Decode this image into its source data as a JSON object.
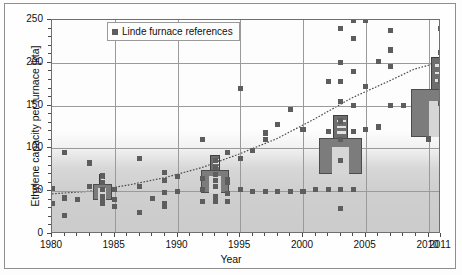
{
  "figure": {
    "background": "#fdfdfd",
    "frame_color": "#8e8e8e"
  },
  "legend": {
    "label": "Linde furnace references",
    "marker": "square-marker",
    "position": "top-left-inside"
  },
  "axes": {
    "x_title": "Year",
    "y_title": "Ethylene capacity per furnace [kta]",
    "x_ticks": [
      "1980",
      "1985",
      "1990",
      "1995",
      "2000",
      "2005",
      "2010",
      "2011"
    ],
    "y_ticks": [
      "0",
      "50",
      "100",
      "150",
      "200",
      "250"
    ]
  },
  "chart_data": {
    "type": "scatter",
    "title": "",
    "subtitle": "",
    "xlabel": "Year",
    "ylabel": "Ethylene capacity per furnace [kta]",
    "xlim": [
      1980,
      2011
    ],
    "ylim": [
      0,
      250
    ],
    "grid": true,
    "legend_position": "top-left-inside",
    "series": [
      {
        "name": "Linde furnace references",
        "marker": "square",
        "color": "#5d5d5d",
        "points": [
          [
            1980,
            53
          ],
          [
            1980,
            36
          ],
          [
            1981,
            95
          ],
          [
            1981,
            42
          ],
          [
            1981,
            22
          ],
          [
            1982,
            40
          ],
          [
            1983,
            83
          ],
          [
            1983,
            55
          ],
          [
            1984,
            68
          ],
          [
            1984,
            60
          ],
          [
            1984,
            52
          ],
          [
            1984,
            44
          ],
          [
            1984,
            40
          ],
          [
            1984,
            36
          ],
          [
            1985,
            52
          ],
          [
            1985,
            40
          ],
          [
            1985,
            32
          ],
          [
            1987,
            88
          ],
          [
            1987,
            56
          ],
          [
            1987,
            25
          ],
          [
            1988,
            41
          ],
          [
            1989,
            72
          ],
          [
            1989,
            63
          ],
          [
            1989,
            48
          ],
          [
            1989,
            36
          ],
          [
            1989,
            32
          ],
          [
            1990,
            67
          ],
          [
            1990,
            50
          ],
          [
            1992,
            110
          ],
          [
            1992,
            65
          ],
          [
            1992,
            52
          ],
          [
            1992,
            38
          ],
          [
            1993,
            86
          ],
          [
            1993,
            78
          ],
          [
            1993,
            70
          ],
          [
            1993,
            62
          ],
          [
            1993,
            55
          ],
          [
            1993,
            44
          ],
          [
            1993,
            38
          ],
          [
            1994,
            95
          ],
          [
            1994,
            64
          ],
          [
            1994,
            60
          ],
          [
            1994,
            47
          ],
          [
            1994,
            38
          ],
          [
            1995,
            170
          ],
          [
            1995,
            88
          ],
          [
            1995,
            52
          ],
          [
            1996,
            98
          ],
          [
            1996,
            50
          ],
          [
            1997,
            118
          ],
          [
            1997,
            110
          ],
          [
            1997,
            50
          ],
          [
            1998,
            128
          ],
          [
            1998,
            50
          ],
          [
            1999,
            145
          ],
          [
            1999,
            50
          ],
          [
            2000,
            122
          ],
          [
            2000,
            50
          ],
          [
            2001,
            52
          ],
          [
            2002,
            178
          ],
          [
            2002,
            120
          ],
          [
            2002,
            52
          ],
          [
            2003,
            240
          ],
          [
            2003,
            200
          ],
          [
            2003,
            178
          ],
          [
            2003,
            155
          ],
          [
            2003,
            132
          ],
          [
            2003,
            110
          ],
          [
            2003,
            86
          ],
          [
            2003,
            52
          ],
          [
            2003,
            30
          ],
          [
            2004,
            250
          ],
          [
            2004,
            228
          ],
          [
            2004,
            190
          ],
          [
            2004,
            150
          ],
          [
            2004,
            120
          ],
          [
            2004,
            52
          ],
          [
            2005,
            250
          ],
          [
            2005,
            172
          ],
          [
            2005,
            122
          ],
          [
            2006,
            202
          ],
          [
            2006,
            125
          ],
          [
            2007,
            238
          ],
          [
            2007,
            215
          ],
          [
            2007,
            196
          ],
          [
            2007,
            150
          ],
          [
            2008,
            150
          ],
          [
            2010,
            111
          ],
          [
            2011,
            240
          ],
          [
            2011,
            212
          ],
          [
            2011,
            178
          ],
          [
            2011,
            152
          ]
        ]
      }
    ],
    "trend": {
      "name": "exponential trend",
      "style": "dotted",
      "color": "#4a4a4a",
      "points": [
        [
          1980,
          45
        ],
        [
          1983,
          48
        ],
        [
          1986,
          55
        ],
        [
          1989,
          64
        ],
        [
          1992,
          76
        ],
        [
          1995,
          92
        ],
        [
          1998,
          110
        ],
        [
          2001,
          133
        ],
        [
          2004,
          158
        ],
        [
          2007,
          178
        ],
        [
          2009,
          192
        ],
        [
          2011,
          200
        ]
      ]
    },
    "furnace_pictograms": [
      {
        "year": 1984,
        "capacity": 55,
        "scale": 0.42
      },
      {
        "year": 1993,
        "capacity": 70,
        "scale": 0.62
      },
      {
        "year": 2003,
        "capacity": 105,
        "scale": 0.95
      },
      {
        "year": 2011,
        "capacity": 160,
        "scale": 1.3
      }
    ]
  }
}
